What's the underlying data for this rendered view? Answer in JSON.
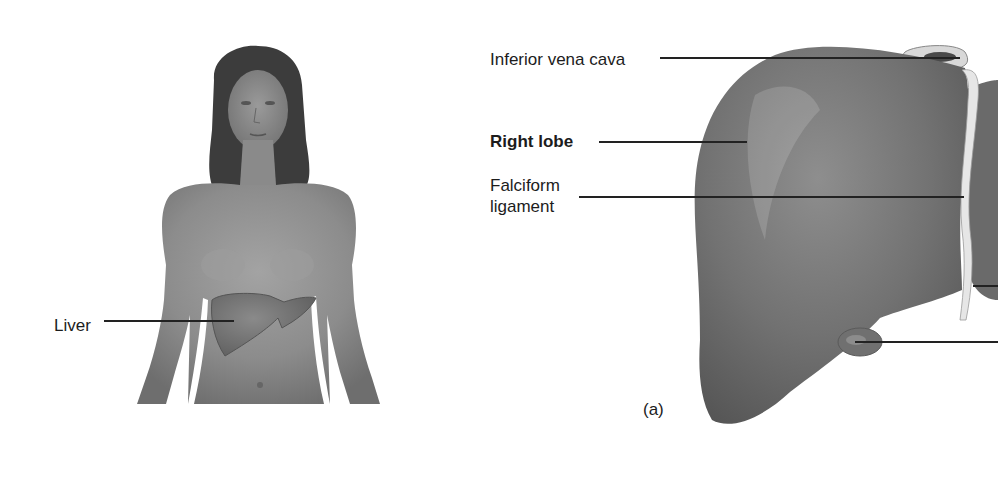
{
  "figure": {
    "panel_label": "(a)",
    "body_view": {
      "labels": [
        {
          "id": "liver",
          "text": "Liver"
        }
      ]
    },
    "liver_view": {
      "labels": [
        {
          "id": "inferior-vena-cava",
          "text": "Inferior vena cava"
        },
        {
          "id": "right-lobe",
          "text": "Right lobe",
          "emphasis": "bold"
        },
        {
          "id": "falciform-ligament-line1",
          "text": "Falciform"
        },
        {
          "id": "falciform-ligament-line2",
          "text": "ligament"
        }
      ]
    }
  },
  "colors": {
    "background": "#ffffff",
    "organ_gray": "#6f6f6f",
    "skin_gray": "#8a8a8a",
    "hair": "#3a3a3a",
    "leader_line": "#222222"
  }
}
